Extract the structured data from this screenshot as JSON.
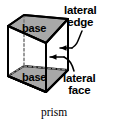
{
  "figure": {
    "title": "prism",
    "shape_type": "triangular-prism",
    "caption": "prism",
    "colors": {
      "stroke": "#000000",
      "base_fill": "#a8a8a8",
      "lateral_face_fill": "#ffffff",
      "hidden_edge": "#808080",
      "background": "#ffffff",
      "text": "#000000"
    }
  },
  "labels": {
    "base_top": "base",
    "base_bottom": "base",
    "lateral_edge_line1": "lateral",
    "lateral_edge_line2": "edge",
    "lateral_face_line1": "lateral",
    "lateral_face_line2": "face"
  },
  "annotations": {
    "lateral_edge": {
      "text": "lateral edge",
      "points_to": "front-vertical-edge",
      "leader": "curved",
      "arrow": "left-pointing"
    },
    "lateral_face": {
      "text": "lateral face",
      "points_to": "right-rectangular-face",
      "leader": "curved",
      "arrow": "left-pointing"
    }
  },
  "icons": {
    "arrow": "arrow-left-icon",
    "leader": "curved-leader-line-icon"
  }
}
